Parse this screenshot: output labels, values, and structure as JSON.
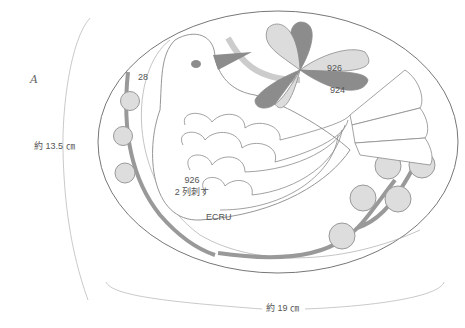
{
  "diagram": {
    "type": "embroidery-pattern",
    "figure_label": "A",
    "dimensions": {
      "height": "約 13.5 ㎝",
      "width": "約 19 ㎝"
    },
    "thread_labels": [
      {
        "id": "outline",
        "text": "28"
      },
      {
        "id": "leaf-light",
        "text": "926"
      },
      {
        "id": "leaf-dark",
        "text": "924"
      },
      {
        "id": "wing",
        "line1": "926",
        "line2": "2 列刺す"
      },
      {
        "id": "body",
        "text": "ECRU"
      }
    ],
    "colors": {
      "line": "#8a8a8a",
      "light_fill": "#dcdcdc",
      "dark_fill": "#8c8c8c",
      "stem": "#999999",
      "background": "#ffffff"
    }
  }
}
